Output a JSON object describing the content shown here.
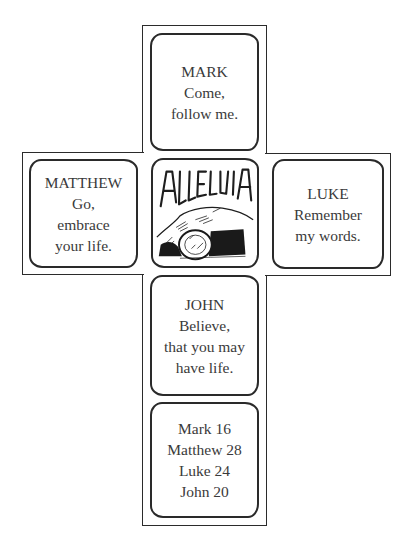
{
  "panels": {
    "mark": {
      "lines": [
        "MARK",
        "Come,",
        "follow me."
      ]
    },
    "matthew": {
      "lines": [
        "MATTHEW",
        "Go,",
        "embrace",
        "your life."
      ]
    },
    "center": {
      "title": "ALLELUIA",
      "illustration": "empty-tomb-with-rolled-stone"
    },
    "luke": {
      "lines": [
        "LUKE",
        "Remember",
        "my words."
      ]
    },
    "john": {
      "lines": [
        "JOHN",
        "Believe,",
        "that you may",
        "have life."
      ]
    },
    "references": {
      "lines": [
        "Mark 16",
        "Matthew 28",
        "Luke 24",
        "John 20"
      ]
    }
  }
}
